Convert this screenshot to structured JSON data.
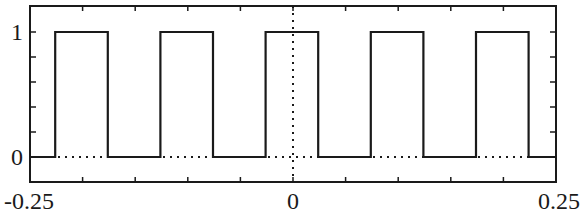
{
  "chart_data": {
    "type": "line",
    "title": "",
    "xlabel": "",
    "ylabel": "",
    "xlim": [
      -0.25,
      0.25
    ],
    "ylim": [
      -0.2,
      1.2
    ],
    "grid": false,
    "legend": null,
    "x_tick_labels": [
      {
        "value": -0.25,
        "label": "-0.25"
      },
      {
        "value": 0,
        "label": "0"
      },
      {
        "value": 0.25,
        "label": "0.25"
      }
    ],
    "y_tick_labels": [
      {
        "value": 0,
        "label": "0"
      },
      {
        "value": 1,
        "label": "1"
      }
    ],
    "x_minor_ticks": [
      -0.2,
      -0.15,
      -0.1,
      -0.05,
      0,
      0.05,
      0.1,
      0.15,
      0.2
    ],
    "y_minor_ticks": [
      0,
      0.2,
      0.4,
      0.6,
      0.8,
      1.0
    ],
    "reference_lines": [
      {
        "orientation": "horizontal",
        "value": 0,
        "style": "dotted"
      },
      {
        "orientation": "vertical",
        "value": 0,
        "style": "dotted"
      }
    ],
    "series": [
      {
        "name": "rectangular pulse train",
        "style": "solid",
        "color": "#1a1a1a",
        "period": 0.1,
        "pulse_width": 0.05,
        "pulse_height": 1,
        "pulses": [
          {
            "start": -0.226,
            "end": -0.176
          },
          {
            "start": -0.126,
            "end": -0.076
          },
          {
            "start": -0.026,
            "end": 0.024
          },
          {
            "start": 0.074,
            "end": 0.124
          },
          {
            "start": 0.174,
            "end": 0.224
          }
        ],
        "x": [
          -0.25,
          -0.226,
          -0.226,
          -0.176,
          -0.176,
          -0.126,
          -0.126,
          -0.076,
          -0.076,
          -0.026,
          -0.026,
          0.024,
          0.024,
          0.074,
          0.074,
          0.124,
          0.124,
          0.174,
          0.174,
          0.224,
          0.224,
          0.25
        ],
        "y": [
          0,
          0,
          1,
          1,
          0,
          0,
          1,
          1,
          0,
          0,
          1,
          1,
          0,
          0,
          1,
          1,
          0,
          0,
          1,
          1,
          0,
          0
        ]
      }
    ]
  },
  "colors": {
    "line": "#1a1a1a",
    "frame": "#1a1a1a",
    "background": "#ffffff"
  }
}
